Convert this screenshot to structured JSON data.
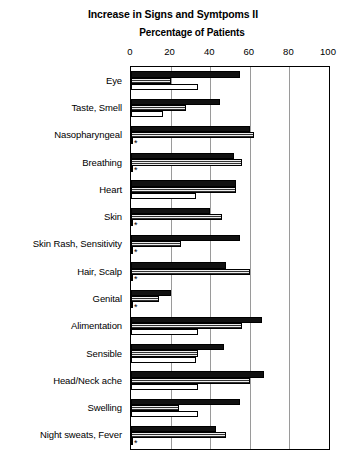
{
  "chart": {
    "title": "Increase in Signs and Symtpoms II",
    "subtitle": "Percentage of Patients",
    "significance_marker": "*"
  },
  "chart_data": {
    "type": "bar",
    "orientation": "horizontal",
    "title": "Increase in Signs and Symtpoms II",
    "subtitle": "Percentage of Patients",
    "xlabel": "Percentage of Patients",
    "ylabel": "",
    "xlim": [
      0,
      100
    ],
    "xticks": [
      0,
      20,
      40,
      60,
      80,
      100
    ],
    "grid": true,
    "grid_axis": "x",
    "legend": "none",
    "categories": [
      "Eye",
      "Taste, Smell",
      "Nasopharyngeal",
      "Breathing",
      "Heart",
      "Skin",
      "Skin Rash, Sensitivity",
      "Hair, Scalp",
      "Genital",
      "Alimentation",
      "Sensible",
      "Head/Neck ache",
      "Swelling",
      "Night sweats, Fever"
    ],
    "series": [
      {
        "name": "Series 1",
        "fill": "solid-black",
        "color": "#111111",
        "values": [
          55,
          45,
          60,
          52,
          53,
          40,
          55,
          48,
          20,
          66,
          47,
          67,
          55,
          43
        ]
      },
      {
        "name": "Series 2",
        "fill": "gray-hatched",
        "color": "#8a8a8a",
        "values": [
          20,
          28,
          62,
          56,
          53,
          46,
          25,
          60,
          14,
          56,
          34,
          60,
          24,
          48
        ]
      },
      {
        "name": "Series 3",
        "fill": "white-open",
        "color": "#ffffff",
        "values": [
          34,
          16,
          1,
          1,
          33,
          1,
          1,
          1,
          1,
          34,
          33,
          34,
          34,
          1
        ],
        "marked_points": [
          "Nasopharyngeal",
          "Breathing",
          "Skin",
          "Skin Rash, Sensitivity",
          "Hair, Scalp",
          "Genital",
          "Night sweats, Fever"
        ]
      }
    ]
  }
}
